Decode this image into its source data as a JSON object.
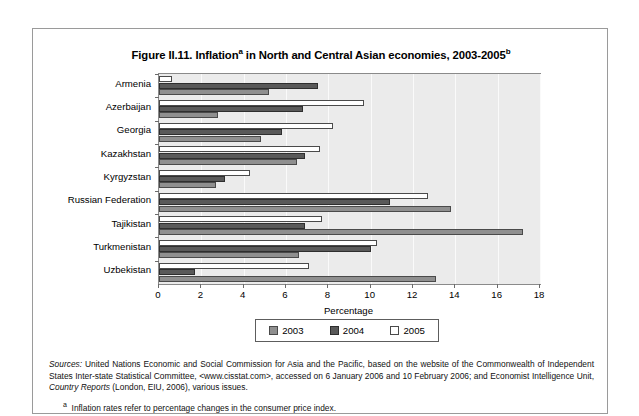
{
  "figure": {
    "title_main": "Figure II.11. Inflation",
    "title_sup_a": "a",
    "title_mid": " in North and Central Asian economies, 2003-2005",
    "title_sup_b": "b"
  },
  "chart_data": {
    "type": "bar",
    "orientation": "horizontal",
    "xlabel": "Percentage",
    "ylabel": "",
    "xlim": [
      0,
      18
    ],
    "xticks": [
      0,
      2,
      4,
      6,
      8,
      10,
      12,
      14,
      16,
      18
    ],
    "grid": true,
    "legend_position": "bottom",
    "categories": [
      "Armenia",
      "Azerbaijan",
      "Georgia",
      "Kazakhstan",
      "Kyrgyzstan",
      "Russian Federation",
      "Tajikistan",
      "Turkmenistan",
      "Uzbekistan"
    ],
    "series": [
      {
        "name": "2003",
        "color": "#8f8f8f",
        "values": [
          5.2,
          2.8,
          4.8,
          6.5,
          2.7,
          13.8,
          17.2,
          6.6,
          13.1
        ]
      },
      {
        "name": "2004",
        "color": "#595959",
        "values": [
          7.5,
          6.8,
          5.8,
          6.9,
          3.1,
          10.9,
          6.9,
          10.0,
          1.7
        ]
      },
      {
        "name": "2005",
        "color": "#ffffff",
        "values": [
          0.6,
          9.7,
          8.2,
          7.6,
          4.3,
          12.7,
          7.7,
          10.3,
          7.1
        ]
      }
    ]
  },
  "legend": {
    "items": [
      {
        "label": "2003"
      },
      {
        "label": "2004"
      },
      {
        "label": "2005"
      }
    ]
  },
  "notes": {
    "sources_lead": "Sources:",
    "sources_text": " United Nations Economic and Social Commission for Asia and the Pacific, based on the website of the Commonwealth of Independent States Inter-state Statistical Committee, <www.cisstat.com>, accessed on 6 January 2006 and 10 February 2006; and Economist Intelligence Unit, ",
    "sources_italic": "Country Reports",
    "sources_tail": " (London, EIU, 2006), various issues.",
    "footnote_a_marker": "a",
    "footnote_a": "Inflation rates refer to percentage changes in the consumer price index."
  }
}
